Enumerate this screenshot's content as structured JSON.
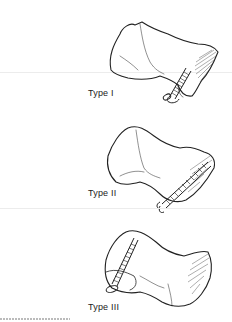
{
  "figure": {
    "panels": [
      {
        "id": "type-1",
        "label": "Type I",
        "description": "Bone with screw inserted from lower front, shaded articular surface on right"
      },
      {
        "id": "type-2",
        "label": "Type II",
        "description": "Bone with long screw running diagonally toward upper right"
      },
      {
        "id": "type-3",
        "label": "Type III",
        "description": "Bone with screw inserted on left side, shaded articular surface on right"
      }
    ]
  },
  "colors": {
    "ink": "#222222",
    "background": "#ffffff"
  }
}
